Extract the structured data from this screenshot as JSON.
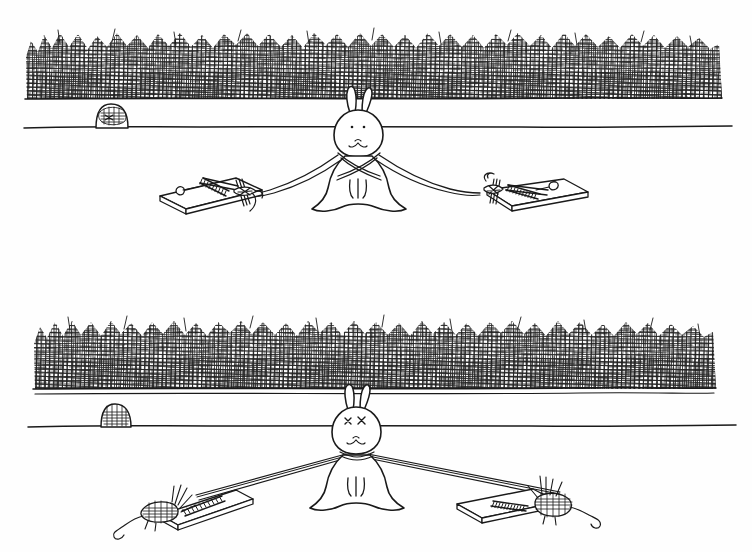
{
  "artwork": {
    "title": "Rabbit and Mousetraps",
    "medium": "pen-and-ink line drawing",
    "style": "black ink on white paper, cross-hatched hedge texture",
    "panel_count": 2,
    "canvas": {
      "width": 752,
      "height": 552,
      "background_color": "#fefefe",
      "ink_color": "#1a1a1a"
    },
    "caption_text": ""
  },
  "panels": [
    {
      "id": "panel-top",
      "name": "top-panel",
      "label": "Before",
      "bounds": {
        "x": 0,
        "y": 0,
        "width": 752,
        "height": 276
      },
      "hedge": {
        "name": "hedge-band",
        "description": "dense cross-hatched hedge or grass band",
        "x1": 26,
        "x2": 722,
        "y_top": 30,
        "y_bottom": 98,
        "hatch_density": "very dense"
      },
      "ground_line": {
        "name": "ground-line",
        "x1": 24,
        "x2": 732,
        "y": 127
      },
      "mouse_hole": {
        "name": "mouse-hole",
        "x": 95,
        "y": 110,
        "width": 34,
        "height": 20,
        "occupied": true,
        "occupant": "mouse peeking out",
        "label": "mouse in burrow"
      },
      "rabbit": {
        "name": "rabbit",
        "x": 357,
        "y": 150,
        "pose": "sitting upright facing viewer",
        "eyes": "dots",
        "status": "alert",
        "ears": 2,
        "harness": "ropes crossed over chest"
      },
      "traps": [
        {
          "name": "mousetrap-left",
          "side": "left",
          "x": 210,
          "y": 196,
          "state": "set",
          "bait": "cheese pellet",
          "catch": "none",
          "rope_attached": true
        },
        {
          "name": "mousetrap-right",
          "side": "right",
          "x": 515,
          "y": 196,
          "state": "set",
          "bait": "cheese pellet",
          "catch": "none",
          "rope_attached": true
        }
      ],
      "ropes": [
        {
          "name": "rope-left",
          "from": "rabbit-chest",
          "to": "mousetrap-left",
          "slack": "sagging"
        },
        {
          "name": "rope-right",
          "from": "rabbit-chest",
          "to": "mousetrap-right",
          "slack": "sagging"
        }
      ]
    },
    {
      "id": "panel-bottom",
      "name": "bottom-panel",
      "label": "After",
      "bounds": {
        "x": 0,
        "y": 276,
        "width": 752,
        "height": 276
      },
      "hedge": {
        "name": "hedge-band",
        "description": "dense cross-hatched hedge or grass band",
        "x1": 34,
        "x2": 716,
        "y_top": 315,
        "y_bottom": 388,
        "hatch_density": "very dense"
      },
      "ground_line": {
        "name": "ground-line",
        "x1": 28,
        "x2": 736,
        "y": 426
      },
      "mouse_hole": {
        "name": "mouse-hole",
        "x": 100,
        "y": 406,
        "width": 30,
        "height": 20,
        "occupied": false,
        "occupant": "empty",
        "label": "empty burrow"
      },
      "rabbit": {
        "name": "rabbit",
        "x": 355,
        "y": 450,
        "pose": "sitting upright facing viewer",
        "eyes": "x x",
        "status": "dazed / knocked out",
        "ears": 2,
        "harness": "ropes pulled taut from both sides"
      },
      "traps": [
        {
          "name": "mousetrap-left",
          "side": "left",
          "x": 185,
          "y": 500,
          "state": "sprung",
          "bait": "none",
          "catch": "mouse caught",
          "rope_attached": true
        },
        {
          "name": "mousetrap-right",
          "side": "right",
          "x": 520,
          "y": 498,
          "state": "sprung",
          "bait": "none",
          "catch": "mouse caught",
          "rope_attached": true
        }
      ],
      "ropes": [
        {
          "name": "rope-left",
          "from": "rabbit-chest",
          "to": "mousetrap-left",
          "slack": "taut"
        },
        {
          "name": "rope-right",
          "from": "rabbit-chest",
          "to": "mousetrap-right",
          "slack": "taut"
        }
      ]
    }
  ]
}
